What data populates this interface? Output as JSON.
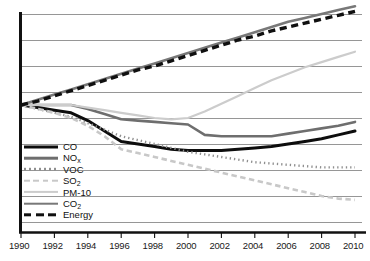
{
  "chart_data": {
    "type": "line",
    "title": "",
    "subtitle": "",
    "xlabel": "",
    "ylabel": "",
    "grid": true,
    "legend_position": "inside-lower-left",
    "x": [
      1990,
      1991,
      1992,
      1993,
      1994,
      1995,
      1996,
      1997,
      1998,
      1999,
      2000,
      2001,
      2002,
      2003,
      2004,
      2005,
      2006,
      2007,
      2008,
      2009,
      2010
    ],
    "xlim": [
      1990,
      2010
    ],
    "xticks": [
      "1990",
      "1992",
      "1994",
      "1996",
      "1998",
      "2000",
      "2002",
      "2004",
      "2006",
      "2008",
      "2010"
    ],
    "ylim": [
      10,
      180
    ],
    "yticks": [],
    "gridline_count": 9,
    "series": [
      {
        "name": "CO",
        "style": "solid",
        "color": "#0d0d0d",
        "width": 3.0,
        "values": [
          100,
          98,
          96,
          94,
          88,
          80,
          72,
          70,
          68,
          66,
          65,
          65,
          65,
          66,
          67,
          68,
          70,
          72,
          74,
          77,
          80
        ]
      },
      {
        "name": "NOx",
        "style": "solid",
        "color": "#6e6e6e",
        "width": 2.6,
        "values": [
          100,
          100,
          100,
          100,
          97,
          93,
          89,
          88,
          87,
          86,
          85,
          77,
          76,
          76,
          76,
          76,
          78,
          80,
          82,
          84,
          87
        ]
      },
      {
        "name": "VOC",
        "style": "dotted",
        "color": "#8f8f8f",
        "width": 2.4,
        "values": [
          100,
          97,
          94,
          91,
          86,
          81,
          76,
          73,
          70,
          67,
          64,
          62,
          60,
          58,
          56,
          55,
          54,
          53,
          52,
          52,
          52
        ]
      },
      {
        "name": "SO2",
        "style": "dashed",
        "color": "#c8c8c8",
        "width": 2.6,
        "values": [
          100,
          97,
          94,
          90,
          84,
          76,
          66,
          63,
          60,
          57,
          54,
          51,
          48,
          45,
          42,
          39,
          36,
          33,
          30,
          28,
          27
        ]
      },
      {
        "name": "PM-10",
        "style": "solid",
        "color": "#cccccc",
        "width": 2.2,
        "values": [
          100,
          100,
          100,
          100,
          98,
          96,
          94,
          92,
          90,
          89,
          90,
          95,
          101,
          107,
          113,
          119,
          124,
          129,
          133,
          137,
          141
        ]
      },
      {
        "name": "CO2",
        "style": "solid",
        "color": "#787878",
        "width": 2.6,
        "values": [
          100,
          104,
          108,
          112,
          116,
          120,
          124,
          128,
          132,
          136,
          140,
          144,
          148,
          152,
          156,
          160,
          164,
          167,
          170,
          173,
          176
        ]
      },
      {
        "name": "Energy",
        "style": "dashed",
        "color": "#101010",
        "width": 3.4,
        "values": [
          100,
          103,
          107,
          111,
          115,
          119,
          123,
          127,
          130,
          134,
          138,
          142,
          146,
          150,
          153,
          157,
          160,
          163,
          166,
          169,
          172
        ]
      }
    ],
    "legend": [
      {
        "label": "CO",
        "sub": "",
        "swatch": "solid-black-thick"
      },
      {
        "label": "NO",
        "sub": "x",
        "swatch": "solid-gray"
      },
      {
        "label": "VOC",
        "sub": "",
        "swatch": "dotted-gray"
      },
      {
        "label": "SO",
        "sub": "2",
        "swatch": "dashed-light"
      },
      {
        "label": "PM-10",
        "sub": "",
        "swatch": "solid-light"
      },
      {
        "label": "CO",
        "sub": "2",
        "swatch": "solid-gray"
      },
      {
        "label": "Energy",
        "sub": "",
        "swatch": "dashed-black-thick"
      }
    ]
  },
  "axis": {
    "tick_labels": [
      "1990",
      "1992",
      "1994",
      "1996",
      "1998",
      "2000",
      "2002",
      "2004",
      "2006",
      "2008",
      "2010"
    ]
  }
}
